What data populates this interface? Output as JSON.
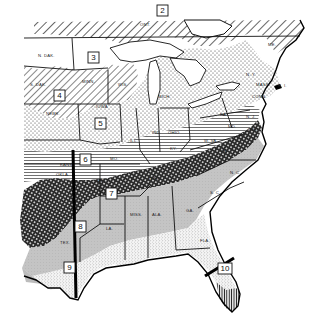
{
  "map": {
    "title": "",
    "region": "Eastern United States",
    "zones": [
      {
        "number": "2",
        "label": "2",
        "pattern": "diagonal-hatch-wide"
      },
      {
        "number": "3",
        "label": "3",
        "pattern": "blank"
      },
      {
        "number": "4",
        "label": "4",
        "pattern": "diagonal-hatch"
      },
      {
        "number": "5",
        "label": "5",
        "pattern": "dots"
      },
      {
        "number": "6",
        "label": "6",
        "pattern": "horizontal-lines"
      },
      {
        "number": "7",
        "label": "7",
        "pattern": "crosshatch-dense"
      },
      {
        "number": "8",
        "label": "8",
        "pattern": "light-gray"
      },
      {
        "number": "9",
        "label": "9",
        "pattern": "fine-stipple"
      },
      {
        "number": "10",
        "label": "10",
        "pattern": "vertical-lines"
      }
    ],
    "states": {
      "ndak": "N. DAK.",
      "sdak": "S. DAK.",
      "nebr": "NEBR.",
      "minn": "MINN.",
      "iowa": "IOWA",
      "wis": "WIS.",
      "mich": "MICH.",
      "ill": "ILL.",
      "ind": "IND.",
      "ohio": "OHIO",
      "kans": "KANS.",
      "mo": "MO.",
      "okla": "OKLA.",
      "ark": "ARK.",
      "tenn": "TENN.",
      "ky": "KY.",
      "wva": "W. VA.",
      "va": "VA.",
      "nc": "N. C.",
      "sc": "S. C.",
      "ga": "GA.",
      "ala": "ALA.",
      "miss": "MISS.",
      "la": "LA.",
      "tex": "TEX.",
      "fla": "FLA.",
      "pa": "PA.",
      "nj": "N. J.",
      "del": "DEL.",
      "md": "MD.",
      "conn": "CONN.",
      "ri": "R. I.",
      "mass": "MASS.",
      "ny": "N. Y.",
      "me": "ME.",
      "ont": "ONT."
    },
    "colors": {
      "ink": "#111111",
      "background": "#ffffff",
      "zone8_fill": "#bdbdbd",
      "zone8_dark": "#8f8f8f"
    }
  }
}
